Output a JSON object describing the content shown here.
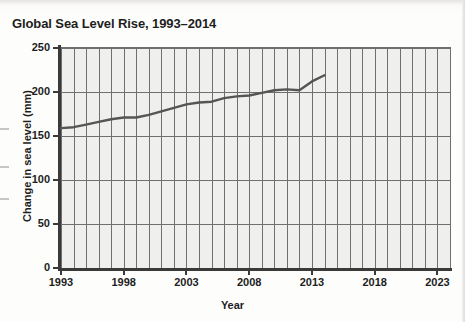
{
  "figure": {
    "title": "Global Sea Level Rise, 1993–2014",
    "x_axis_title": "Year",
    "y_axis_title": "Change in sea level (mm)"
  },
  "chart_data": {
    "type": "line",
    "title": "Global Sea Level Rise, 1993–2014",
    "xlabel": "Year",
    "ylabel": "Change in sea level (mm)",
    "xlim": [
      1993,
      2024
    ],
    "ylim": [
      0,
      250
    ],
    "xticks": [
      1993,
      1998,
      2003,
      2008,
      2013,
      2018,
      2023
    ],
    "xtick_labels": [
      "1993",
      "1998",
      "2003",
      "2008",
      "2013",
      "2018",
      "2023"
    ],
    "yticks": [
      0,
      50,
      100,
      150,
      200,
      250
    ],
    "ytick_labels": [
      "0",
      "50",
      "100",
      "150",
      "200",
      "250"
    ],
    "grid": "both",
    "minor_x_gridlines_every": 1,
    "legend": "none",
    "line_color": "#555555",
    "plot_background": "#efefee",
    "series": [
      {
        "name": "Change in sea level",
        "x": [
          1993,
          1994,
          1995,
          1996,
          1997,
          1998,
          1999,
          2000,
          2001,
          2002,
          2003,
          2004,
          2005,
          2006,
          2007,
          2008,
          2009,
          2010,
          2011,
          2012,
          2013,
          2014
        ],
        "values": [
          159,
          160,
          163,
          166,
          169,
          171,
          171,
          174,
          178,
          182,
          186,
          188,
          189,
          193,
          195,
          196,
          199,
          202,
          203,
          202,
          212,
          219
        ]
      }
    ]
  }
}
